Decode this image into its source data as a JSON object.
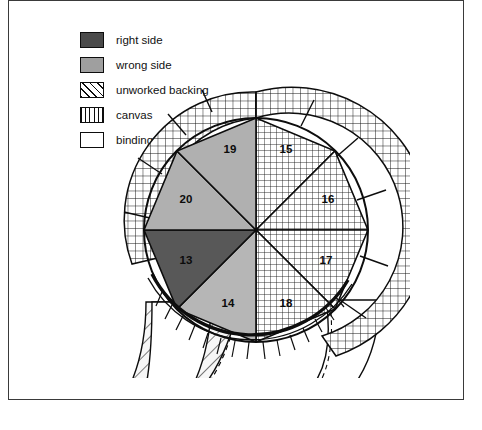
{
  "figure": {
    "title_visible": false,
    "frame": {
      "border_color": "#3a3a3a"
    },
    "background": "#ffffff"
  },
  "legend": {
    "items": [
      {
        "key": "right-side",
        "label": "right side",
        "swatch": "solid-dark-gray",
        "color": "#4a4a4a"
      },
      {
        "key": "wrong-side",
        "label": "wrong side",
        "swatch": "solid-light-gray",
        "color": "#9f9f9f"
      },
      {
        "key": "unworked-backing",
        "label": "unworked backing",
        "swatch": "diagonal-hatch",
        "color": "#ffffff"
      },
      {
        "key": "canvas",
        "label": "canvas",
        "swatch": "grid-mesh",
        "color": "#ffffff"
      },
      {
        "key": "binding",
        "label": "binding",
        "swatch": "plain-white",
        "color": "#ffffff"
      }
    ]
  },
  "diagram": {
    "type": "sector-wheel",
    "center": {
      "x": 166,
      "y": 152
    },
    "inner_radius": 112,
    "outer_band_radius": 138,
    "sector_count": 8,
    "sectors": [
      {
        "number": "15",
        "fill": "canvas",
        "start_deg": -90,
        "end_deg": -45,
        "label_x": 196,
        "label_y": 72
      },
      {
        "number": "16",
        "fill": "canvas",
        "start_deg": -45,
        "end_deg": 0,
        "label_x": 240,
        "label_y": 120
      },
      {
        "number": "17",
        "fill": "canvas",
        "start_deg": 0,
        "end_deg": 45,
        "label_x": 240,
        "label_y": 182
      },
      {
        "number": "18",
        "fill": "canvas",
        "start_deg": 45,
        "end_deg": 90,
        "label_x": 196,
        "label_y": 227
      },
      {
        "number": "14",
        "fill": "wrong-side",
        "start_deg": 90,
        "end_deg": 135,
        "label_x": 136,
        "label_y": 226
      },
      {
        "number": "13",
        "fill": "right-side",
        "start_deg": 135,
        "end_deg": 180,
        "label_x": 92,
        "label_y": 182
      },
      {
        "number": "20",
        "fill": "wrong-side",
        "start_deg": 180,
        "end_deg": 225,
        "label_x": 92,
        "label_y": 120
      },
      {
        "number": "19",
        "fill": "wrong-side",
        "start_deg": 225,
        "end_deg": 270,
        "label_x": 138,
        "label_y": 72
      }
    ],
    "outer_band": {
      "fill": "canvas",
      "spans_deg": [
        -100,
        62
      ],
      "divider_count": 8,
      "note": "mesh band wrapping upper-left through lower-right of wheel"
    },
    "flaps": [
      {
        "key": "left-flap",
        "fill": "unworked-backing",
        "side": "left",
        "description": "hatched unworked backing wedge folded out at left"
      },
      {
        "key": "left-binding",
        "fill": "binding",
        "side": "left",
        "description": "white binding strip on left flap"
      },
      {
        "key": "right-binding",
        "fill": "binding",
        "side": "right",
        "description": "white binding strip folded out at right"
      }
    ],
    "bottom_edge": {
      "key": "whipped-stitching",
      "description": "whipped stitch hatching along lower arc"
    }
  }
}
